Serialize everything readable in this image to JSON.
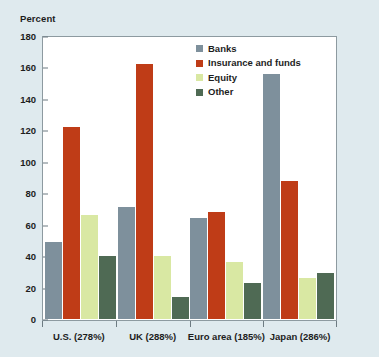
{
  "chart_data": {
    "type": "bar",
    "title": "",
    "subtitle": "",
    "xlabel": "",
    "ylabel": "Percent",
    "ylim": [
      0,
      180
    ],
    "yticks": [
      0,
      20,
      40,
      60,
      80,
      100,
      120,
      140,
      160,
      180
    ],
    "grid": false,
    "legend_position": "top-center-right",
    "categories": [
      "U.S. (278%)",
      "UK (288%)",
      "Euro area (185%)",
      "Japan (286%)"
    ],
    "series": [
      {
        "name": "Banks",
        "color": "#7e909c",
        "values": [
          49,
          71,
          64,
          156
        ]
      },
      {
        "name": "Insurance and funds",
        "color": "#bf3c17",
        "values": [
          122,
          162,
          68,
          88
        ]
      },
      {
        "name": "Equity",
        "color": "#d9e8a3",
        "values": [
          66,
          40,
          36,
          26
        ]
      },
      {
        "name": "Other",
        "color": "#4f6a54",
        "values": [
          40,
          14,
          23,
          29
        ]
      }
    ]
  },
  "colors": {
    "background": "#dfeaee",
    "plot_background": "#ffffff",
    "axis": "#6d7b82",
    "text": "#1d1d1d"
  }
}
